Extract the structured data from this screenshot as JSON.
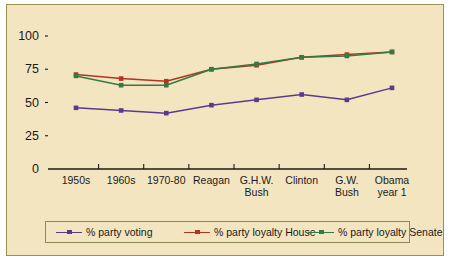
{
  "figure": {
    "background_color": "#f4e5c1",
    "border_color": "#9a9050"
  },
  "chart_data": {
    "type": "line",
    "title": "",
    "xlabel": "",
    "ylabel": "",
    "ylim": [
      0,
      100
    ],
    "yticks": [
      0,
      25,
      50,
      75,
      100
    ],
    "ytick_labels": [
      "0",
      "25",
      "50",
      "75",
      "100"
    ],
    "grid": false,
    "legend_position": "bottom",
    "categories": [
      "1950s",
      "1960s",
      "1970-80",
      "Reagan",
      "G.H.W. Bush",
      "Clinton",
      "G.W. Bush",
      "Obama year 1"
    ],
    "category_lines": [
      [
        "1950s"
      ],
      [
        "1960s"
      ],
      [
        "1970-80"
      ],
      [
        "Reagan"
      ],
      [
        "G.H.W.",
        "Bush"
      ],
      [
        "Clinton"
      ],
      [
        "G.W.",
        "Bush"
      ],
      [
        "Obama",
        "year 1"
      ]
    ],
    "series": [
      {
        "name": "% party voting",
        "color": "#5b3a8e",
        "values": [
          46,
          44,
          42,
          48,
          52,
          56,
          52,
          61
        ]
      },
      {
        "name": "% party loyalty House",
        "color": "#b5341f",
        "values": [
          71,
          68,
          66,
          75,
          78,
          84,
          86,
          88
        ]
      },
      {
        "name": "% party loyalty Senate",
        "color": "#2f7d45",
        "values": [
          70,
          63,
          63,
          75,
          79,
          84,
          85,
          88
        ]
      }
    ]
  },
  "legend": {
    "entries": [
      {
        "label": "% party voting",
        "color": "#5b3a8e"
      },
      {
        "label": "% party loyalty House",
        "color": "#b5341f"
      },
      {
        "label": "% party loyalty Senate",
        "color": "#2f7d45"
      }
    ]
  }
}
